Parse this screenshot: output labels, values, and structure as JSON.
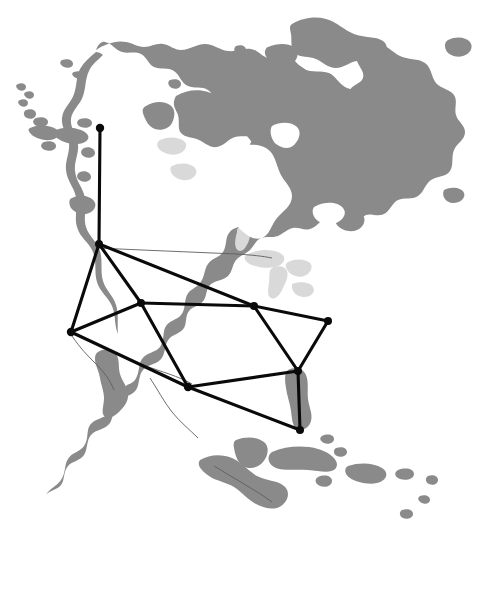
{
  "figure": {
    "width": 482,
    "height": 593,
    "background_color": "#ffffff",
    "land_color": "#8a8a8a",
    "inland_water_color": "#d9d9d9",
    "ocean_color": "#ffffff",
    "border_color": "#5e5e5e",
    "network_color": "#0a0a0a"
  },
  "chart_data": {
    "type": "scatter",
    "xlabel": "",
    "ylabel": "",
    "xlim": [
      0,
      482
    ],
    "ylim": [
      0,
      593
    ],
    "grid": false,
    "legend": "none",
    "basemap": "North America continental outline, gray landmass on white ocean",
    "nodes": [
      {
        "id": "n1",
        "name": "node-1",
        "x": 100,
        "y": 128,
        "radius": 4.2
      },
      {
        "id": "n2",
        "name": "node-2",
        "x": 99,
        "y": 244,
        "radius": 4.0
      },
      {
        "id": "n3",
        "name": "node-3",
        "x": 141,
        "y": 303,
        "radius": 4.0
      },
      {
        "id": "n4",
        "name": "node-4",
        "x": 71,
        "y": 332,
        "radius": 4.2
      },
      {
        "id": "n5",
        "name": "node-5",
        "x": 254,
        "y": 306,
        "radius": 4.0
      },
      {
        "id": "n6",
        "name": "node-6",
        "x": 328,
        "y": 321,
        "radius": 4.0
      },
      {
        "id": "n7",
        "name": "node-7",
        "x": 188,
        "y": 387,
        "radius": 4.2
      },
      {
        "id": "n8",
        "name": "node-8",
        "x": 298,
        "y": 371,
        "radius": 4.0
      },
      {
        "id": "n9",
        "name": "node-9",
        "x": 300,
        "y": 430,
        "radius": 4.0
      }
    ],
    "edges": [
      {
        "from": "n1",
        "to": "n2"
      },
      {
        "from": "n2",
        "to": "n3"
      },
      {
        "from": "n2",
        "to": "n4"
      },
      {
        "from": "n2",
        "to": "n5"
      },
      {
        "from": "n3",
        "to": "n4"
      },
      {
        "from": "n3",
        "to": "n5"
      },
      {
        "from": "n3",
        "to": "n7"
      },
      {
        "from": "n4",
        "to": "n7"
      },
      {
        "from": "n5",
        "to": "n6"
      },
      {
        "from": "n5",
        "to": "n8"
      },
      {
        "from": "n6",
        "to": "n8"
      },
      {
        "from": "n7",
        "to": "n8"
      },
      {
        "from": "n7",
        "to": "n9"
      },
      {
        "from": "n8",
        "to": "n9"
      }
    ],
    "node_count": 9,
    "edge_count": 14
  }
}
